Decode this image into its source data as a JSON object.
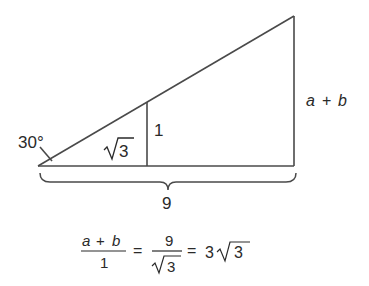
{
  "diagram": {
    "type": "similar-right-triangles",
    "angle_label": "30°",
    "small_triangle": {
      "adjacent_label_radicand": "3",
      "opposite_label": "1"
    },
    "large_triangle": {
      "opposite_label_a": "a",
      "opposite_label_op": "+",
      "opposite_label_b": "b",
      "base_label": "9"
    },
    "colors": {
      "stroke": "#4a4a4a",
      "text": "#2a2a2a",
      "background": "#ffffff"
    }
  },
  "equation": {
    "frac1_num_a": "a",
    "frac1_num_op": "+",
    "frac1_num_b": "b",
    "frac1_den": "1",
    "eq1": "=",
    "frac2_num": "9",
    "frac2_den_radicand": "3",
    "eq2": "=",
    "coef": "3",
    "result_radicand": "3"
  }
}
